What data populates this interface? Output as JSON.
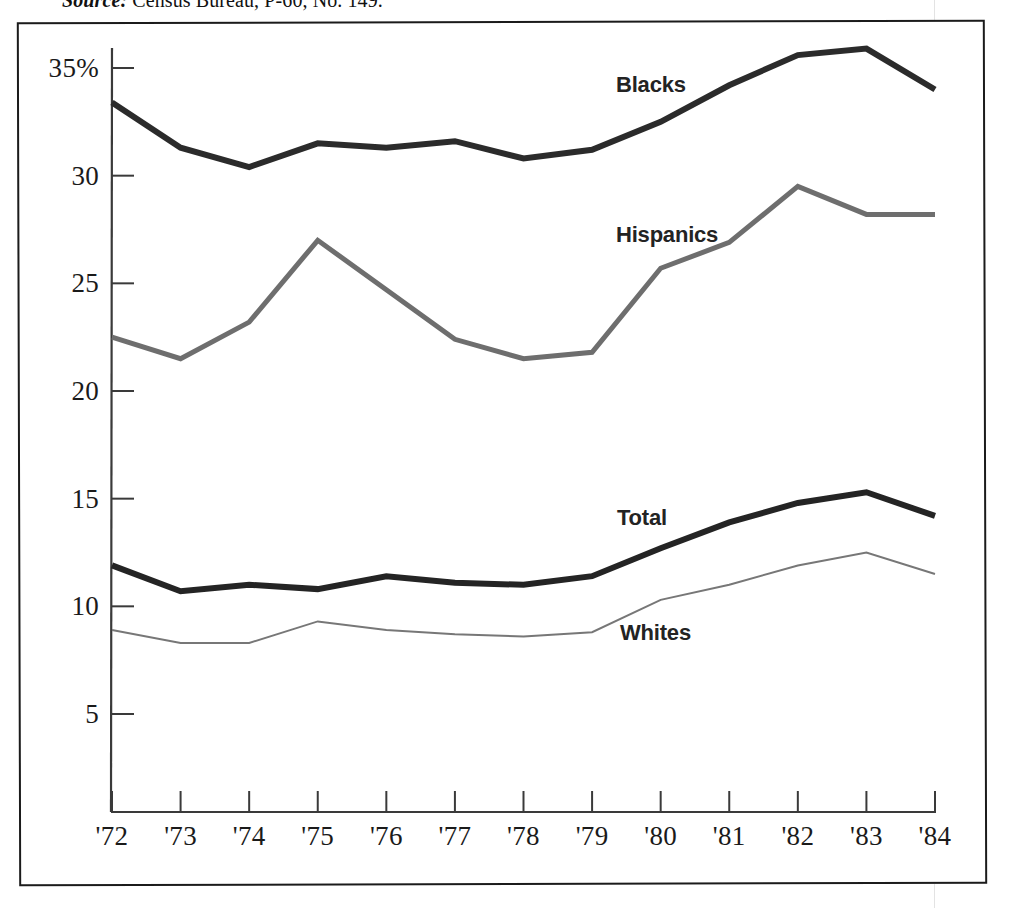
{
  "caption": {
    "source_label": "Source:",
    "source_text": " Census Bureau, P-60, No. 149."
  },
  "axes": {
    "y_ticks": [
      {
        "value": 35,
        "label": "35%"
      },
      {
        "value": 30,
        "label": "30"
      },
      {
        "value": 25,
        "label": "25"
      },
      {
        "value": 20,
        "label": "20"
      },
      {
        "value": 15,
        "label": "15"
      },
      {
        "value": 10,
        "label": "10"
      },
      {
        "value": 5,
        "label": "5"
      }
    ],
    "x_ticks": [
      "'72",
      "'73",
      "'74",
      "'75",
      "'76",
      "'77",
      "'78",
      "'79",
      "'80",
      "'81",
      "'82",
      "'83",
      "'84"
    ]
  },
  "series_labels": {
    "blacks": "Blacks",
    "hispanics": "Hispanics",
    "total": "Total",
    "whites": "Whites"
  },
  "colors": {
    "blacks": "#2b2b2b",
    "hispanics": "#6e6e6e",
    "total": "#242424",
    "whites": "#777777",
    "axis": "#3a3a3a",
    "frame": "#1b1b1b"
  },
  "chart_data": {
    "type": "line",
    "title": "",
    "xlabel": "",
    "ylabel": "",
    "categories": [
      "'72",
      "'73",
      "'74",
      "'75",
      "'76",
      "'77",
      "'78",
      "'79",
      "'80",
      "'81",
      "'82",
      "'83",
      "'84"
    ],
    "x": [
      1972,
      1973,
      1974,
      1975,
      1976,
      1977,
      1978,
      1979,
      1980,
      1981,
      1982,
      1983,
      1984
    ],
    "ylim": [
      0,
      37
    ],
    "y_axis_unit": "percent",
    "grid": false,
    "legend": "inline-annotations",
    "series": [
      {
        "name": "Blacks",
        "color": "#2b2b2b",
        "line_width": 6,
        "values": [
          33.4,
          31.3,
          30.4,
          31.5,
          31.3,
          31.6,
          30.8,
          31.2,
          32.5,
          34.2,
          35.6,
          35.9,
          34.0
        ]
      },
      {
        "name": "Hispanics",
        "color": "#6e6e6e",
        "line_width": 5,
        "values": [
          22.5,
          21.5,
          23.2,
          27.0,
          24.7,
          22.4,
          21.5,
          21.8,
          25.7,
          26.9,
          29.5,
          28.2,
          28.2
        ]
      },
      {
        "name": "Total",
        "color": "#242424",
        "line_width": 6,
        "values": [
          11.9,
          10.7,
          11.0,
          10.8,
          11.4,
          11.1,
          11.0,
          11.4,
          12.7,
          13.9,
          14.8,
          15.3,
          14.2
        ]
      },
      {
        "name": "Whites",
        "color": "#777777",
        "line_width": 2,
        "values": [
          8.9,
          8.3,
          8.3,
          9.3,
          8.9,
          8.7,
          8.6,
          8.8,
          10.3,
          11.0,
          11.9,
          12.5,
          11.5
        ]
      }
    ]
  },
  "geometry": {
    "x_left_px": 112,
    "x_right_px": 935,
    "y_top_value": 35,
    "y_top_px": 68,
    "y_bottom_value": 5,
    "y_bottom_px": 714,
    "axis_bottom_px": 812
  }
}
